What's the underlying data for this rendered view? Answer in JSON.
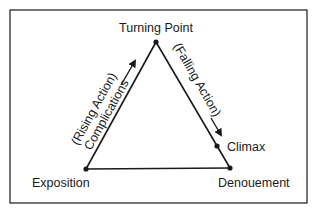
{
  "diagram": {
    "nodes": {
      "turning_point": "Turning Point",
      "exposition": "Exposition",
      "denouement": "Denouement",
      "climax": "Climax"
    },
    "edges": {
      "rising_line1": "(Rising Action)",
      "rising_line2": "Complications",
      "falling": "(Falling Action)"
    },
    "colors": {
      "ink": "#1a1a1a",
      "background": "#ffffff"
    }
  }
}
